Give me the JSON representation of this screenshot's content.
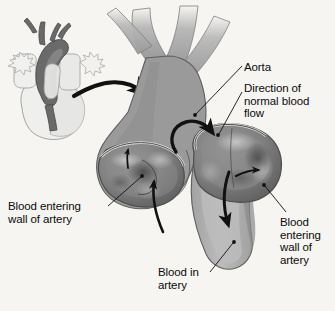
{
  "figure": {
    "background_color": "#f6f5f2",
    "ink_color": "#0b0b0b"
  },
  "labels": {
    "aorta": "Aorta",
    "direction": "Direction of\nnormal blood\nflow",
    "left_wall": "Blood entering\nwall of artery",
    "right_wall": "Blood\nentering\nwall of\nartery",
    "blood_in_artery": "Blood in\nartery"
  },
  "palette": {
    "vessel_mid_gray": "#9a9a9a",
    "vessel_light_gray": "#b4b4b4",
    "vessel_dark_gray": "#6f6f6f",
    "aneurysm_interior": "#7b7b7b",
    "outline": "#3a3a3a",
    "inset_heart_fill": "#efefed",
    "inset_vessel_fill": "#6a6a6a",
    "arrow_black": "#111111"
  },
  "inset": {
    "name": "heart-overview-inset",
    "description": "small whole heart with aortic arch highlighted"
  },
  "flow_arrows": {
    "pointer": "curved thick arrow from inset to main aorta",
    "normal_flow": "curved arrow into aortic arch",
    "descending_flow": "arrow down the descending aorta",
    "left_entry": "arrow entering left aneurysm wall",
    "right_entry": "arrow entering right aneurysm wall",
    "upward_tick": "small upward arrow in aortic root"
  }
}
